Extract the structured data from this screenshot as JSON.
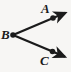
{
  "figure": {
    "kind": "angle-diagram",
    "background_color": "#f7f6f4",
    "stroke_color": "#1b1b1b",
    "width": 71,
    "height": 72,
    "labels": {
      "a": "A",
      "b": "B",
      "c": "C"
    },
    "points": {
      "a": {
        "x": 53,
        "y": 15
      },
      "b": {
        "x": 13,
        "y": 35
      },
      "c": {
        "x": 53,
        "y": 51
      }
    },
    "rays": [
      {
        "name": "ray-BA",
        "from": "B",
        "through": "A",
        "tip_x": 69,
        "tip_y": 12,
        "arrow": "solid-triangle"
      },
      {
        "name": "ray-BC",
        "from": "B",
        "through": "C",
        "tip_x": 69,
        "tip_y": 58,
        "arrow": "solid-triangle"
      }
    ]
  }
}
